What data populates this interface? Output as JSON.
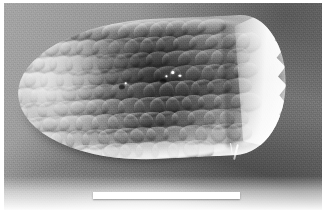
{
  "figure": {
    "domain": "Natural-Image",
    "kind": "scanning-electron-micrograph",
    "caption": "",
    "border_color": "#ffffff",
    "background_color": "#8c8c8c"
  },
  "micrograph": {
    "subject_label": "scale-covered ovate specimen",
    "subject_description": "Elongate-ovate body densely covered in overlapping imbricate scales, rounded at the left (anterior) end and broken/torn at the right (posterior) end, resting on a gray substrate and casting a dark shadow.",
    "orientation": "anterior-left",
    "lighting": "upper-left illumination with bright rim highlights along dorsal and ventral margins",
    "features": [
      {
        "name": "anterior-cap",
        "label": "rounded anterior end"
      },
      {
        "name": "imbricate-scales",
        "label": "overlapping scale lattice"
      },
      {
        "name": "posterior-torn-edge",
        "label": "bright torn posterior margin"
      },
      {
        "name": "seta-filament",
        "label": "thin projecting filament"
      },
      {
        "name": "charging-highlights",
        "label": "bright charging specks"
      },
      {
        "name": "cast-shadow",
        "label": "shadow cast on substrate"
      }
    ]
  },
  "scale_bar": {
    "label": "",
    "color": "#ffffff",
    "length_px": 147,
    "thickness_px": 7,
    "position": "bottom-center"
  }
}
